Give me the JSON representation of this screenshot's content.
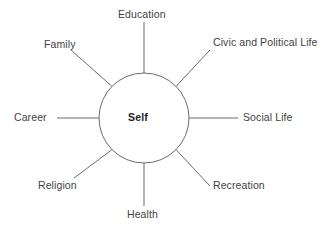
{
  "diagram": {
    "type": "radial-spoke-diagram",
    "center": {
      "label": "Self"
    },
    "colors": {
      "line": "#6b6b6b",
      "text": "#3f3f3f",
      "center_text": "#242424",
      "background": "#ffffff"
    },
    "spokes": [
      {
        "label": "Education",
        "position": "top"
      },
      {
        "label": "Civic and Political Life",
        "position": "upper-right"
      },
      {
        "label": "Social Life",
        "position": "right"
      },
      {
        "label": "Recreation",
        "position": "lower-right"
      },
      {
        "label": "Health",
        "position": "bottom"
      },
      {
        "label": "Religion",
        "position": "lower-left"
      },
      {
        "label": "Career",
        "position": "left"
      },
      {
        "label": "Family",
        "position": "upper-left"
      }
    ]
  }
}
